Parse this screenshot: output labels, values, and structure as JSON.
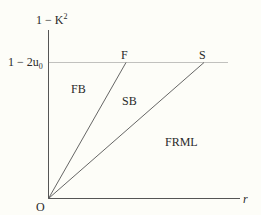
{
  "diagram": {
    "y_axis_label": "1 − K",
    "y_axis_label_sup": "2",
    "x_axis_label": "r",
    "origin_label": "O",
    "threshold_label": "1 − 2u",
    "threshold_label_sub": "0",
    "line_endpoints": [
      {
        "name": "F",
        "label": "F"
      },
      {
        "name": "S",
        "label": "S"
      }
    ],
    "regions": [
      {
        "name": "FB",
        "label": "FB"
      },
      {
        "name": "SB",
        "label": "SB"
      },
      {
        "name": "FRML",
        "label": "FRML"
      }
    ],
    "colors": {
      "background": "#fdfdf8",
      "line": "#555555",
      "text": "#2a2a2a"
    }
  }
}
